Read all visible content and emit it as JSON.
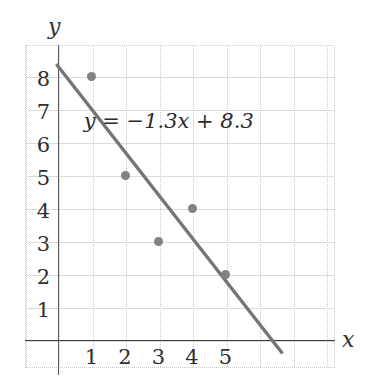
{
  "chart_data": {
    "type": "scatter",
    "title": "",
    "xlabel": "x",
    "ylabel": "y",
    "xlim": [
      -1,
      8.25
    ],
    "ylim": [
      -0.85,
      8.95
    ],
    "grid": true,
    "legend": false,
    "x_ticks": [
      "1",
      "2",
      "3",
      "4",
      "5"
    ],
    "y_ticks": [
      "1",
      "2",
      "3",
      "4",
      "5",
      "6",
      "7",
      "8"
    ],
    "points": [
      {
        "x": 1,
        "y": 8
      },
      {
        "x": 2,
        "y": 5
      },
      {
        "x": 3,
        "y": 3
      },
      {
        "x": 4,
        "y": 4
      },
      {
        "x": 5,
        "y": 2
      }
    ],
    "series": [
      {
        "name": "data points",
        "x": [
          1,
          2,
          3,
          4,
          5
        ],
        "values": [
          8,
          5,
          3,
          4,
          2
        ]
      }
    ],
    "trendline": {
      "equation": "y = −1.3x + 8.3",
      "slope": -1.3,
      "intercept": 8.3,
      "x_start": -0.05,
      "x_end": 6.7
    },
    "annotations": [
      {
        "text": "y = −1.3x + 8.3",
        "x": 2.5,
        "y": 6.6
      }
    ],
    "colors": {
      "point": "#828282",
      "trendline": "#757575",
      "axis": "#3a3a3c",
      "grid_vertical": "#c9c9c9",
      "grid_horizontal": "#dcdcdc",
      "text": "#2f2f2f",
      "background": "#ffffff"
    }
  }
}
